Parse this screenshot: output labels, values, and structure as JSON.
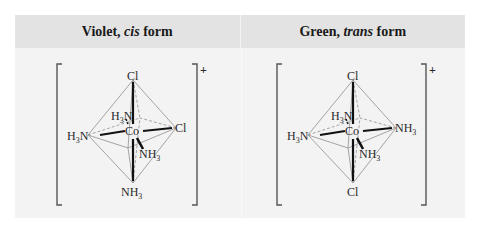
{
  "headers": [
    {
      "color_word": "Violet,",
      "isomer": "cis",
      "suffix": "form"
    },
    {
      "color_word": "Green,",
      "isomer": "trans",
      "suffix": "form"
    }
  ],
  "panels": [
    {
      "name": "cis",
      "charge": "+",
      "center": "Co",
      "ligands": {
        "top": "Cl",
        "bottom": "NH3",
        "left": "H3N",
        "right": "Cl",
        "back": "H3N",
        "front": "NH3"
      }
    },
    {
      "name": "trans",
      "charge": "+",
      "center": "Co",
      "ligands": {
        "top": "Cl",
        "bottom": "Cl",
        "left": "H3N",
        "right": "NH3",
        "back": "H3N",
        "front": "NH3"
      }
    }
  ],
  "colors": {
    "header_bg": "#e3e3e3",
    "body_bg": "#f3f3f3",
    "bond": "#111111",
    "edge": "#9a9a9a",
    "text": "#2a2a2a"
  }
}
